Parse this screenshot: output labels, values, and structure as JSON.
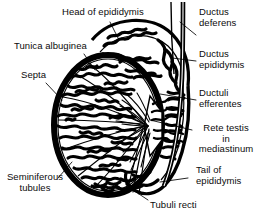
{
  "figure": {
    "width": 263,
    "height": 222,
    "background_color": "#ffffff",
    "ink_color": "#000000"
  },
  "labels": {
    "head_of_epididymis": "Head of epididymis",
    "tunica_albuginea": "Tunica albuginea",
    "septa": "Septa",
    "seminiferous_tubules": "Seminiferous\ntubules",
    "ductus_deferens": "Ductus\ndeferens",
    "ductus_epididymis": "Ductus\nepididymis",
    "ductuli_efferentes": "Ductuli\nefferentes",
    "rete_testis": "Rete testis\nin\nmediastinum",
    "tail_of_epididymis": "Tail of\nepididymis",
    "tubuli_recti": "Tubuli recti"
  },
  "structures": [
    {
      "name": "testis-body",
      "label_key": "tunica_albuginea"
    },
    {
      "name": "head-of-epididymis",
      "label_key": "head_of_epididymis"
    },
    {
      "name": "body-of-epididymis",
      "label_key": "ductus_epididymis"
    },
    {
      "name": "tail-of-epididymis",
      "label_key": "tail_of_epididymis"
    },
    {
      "name": "ductus-deferens",
      "label_key": "ductus_deferens"
    },
    {
      "name": "ductuli-efferentes",
      "label_key": "ductuli_efferentes"
    },
    {
      "name": "rete-testis-mediastinum",
      "label_key": "rete_testis"
    },
    {
      "name": "seminiferous-tubules",
      "label_key": "seminiferous_tubules"
    },
    {
      "name": "septa",
      "label_key": "septa"
    },
    {
      "name": "tubuli-recti",
      "label_key": "tubuli_recti"
    }
  ]
}
